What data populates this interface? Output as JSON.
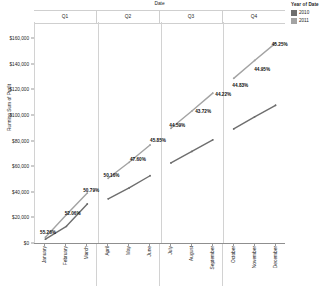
{
  "legend": {
    "title": "Year of Date",
    "items": [
      {
        "label": "2010",
        "color": "#6e6e6e"
      },
      {
        "label": "2011",
        "color": "#a3a3a3"
      }
    ]
  },
  "axes": {
    "column_title": "Date",
    "y_title": "Running Sum of Profit",
    "panels": [
      "Q1",
      "Q2",
      "Q3",
      "Q4"
    ],
    "y_ticks": [
      "$0",
      "$20,000",
      "$40,000",
      "$60,000",
      "$80,000",
      "$100,000",
      "$120,000",
      "$140,000",
      "$160,000"
    ],
    "x_labels": [
      "January",
      "February",
      "March",
      "April",
      "May",
      "June",
      "July",
      "August",
      "September",
      "October",
      "November",
      "December"
    ]
  },
  "chart_data": {
    "type": "line",
    "title": "",
    "xlabel": "Date",
    "ylabel": "Running Sum of Profit",
    "ylim": [
      0,
      160000
    ],
    "ytick_step": 20000,
    "grid": false,
    "legend_position": "right",
    "legend_title": "Year of Date",
    "panels": [
      "Q1",
      "Q2",
      "Q3",
      "Q4"
    ],
    "categories": [
      "January",
      "February",
      "March",
      "April",
      "May",
      "June",
      "July",
      "August",
      "September",
      "October",
      "November",
      "December"
    ],
    "series": [
      {
        "name": "2010",
        "color": "#6e6e6e",
        "values": [
          3000,
          13000,
          30500,
          34500,
          43000,
          52500,
          62500,
          71500,
          80500,
          89000,
          98500,
          107500
        ]
      },
      {
        "name": "2011",
        "color": "#a3a3a3",
        "values": [
          4500,
          22000,
          39000,
          50500,
          63000,
          76500,
          89500,
          103000,
          117000,
          128500,
          142500,
          156000
        ]
      }
    ],
    "annotations": [
      {
        "text": "55.26%",
        "category": "January",
        "x_pct": 5.2,
        "y_px": 232
      },
      {
        "text": "52.06%",
        "category": "February",
        "x_pct": 15.0,
        "y_px": 213
      },
      {
        "text": "50.79%",
        "category": "March",
        "x_pct": 22.4,
        "y_px": 190
      },
      {
        "text": "50.16%",
        "category": "April",
        "x_pct": 30.5,
        "y_px": 175
      },
      {
        "text": "47.60%",
        "category": "May",
        "x_pct": 41.0,
        "y_px": 159
      },
      {
        "text": "45.85%",
        "category": "June",
        "x_pct": 49.0,
        "y_px": 140
      },
      {
        "text": "44.59%",
        "category": "July",
        "x_pct": 56.7,
        "y_px": 125
      },
      {
        "text": "43.72%",
        "category": "August",
        "x_pct": 67.0,
        "y_px": 111
      },
      {
        "text": "44.22%",
        "category": "September",
        "x_pct": 75.0,
        "y_px": 94
      },
      {
        "text": "44.83%",
        "category": "October",
        "x_pct": 81.8,
        "y_px": 85
      },
      {
        "text": "44.95%",
        "category": "November",
        "x_pct": 90.5,
        "y_px": 69
      },
      {
        "text": "45.25%",
        "category": "December",
        "x_pct": 97.5,
        "y_px": 44
      }
    ]
  }
}
